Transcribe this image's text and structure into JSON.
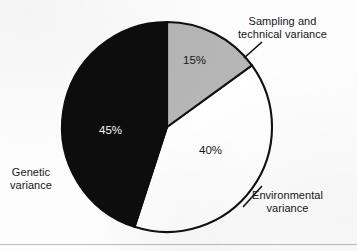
{
  "chart_data": {
    "type": "pie",
    "title": "",
    "subtitle": "",
    "xlabel": "",
    "ylabel": "",
    "legend_position": "none",
    "grid": false,
    "units": "percent",
    "total": 100,
    "start_angle_deg": 0,
    "direction": "clockwise",
    "categories": [
      "Sampling and technical variance",
      "Environmental variance",
      "Genetic variance"
    ],
    "values": [
      15,
      40,
      45
    ],
    "slices": [
      {
        "label": "Sampling and technical variance",
        "label_line1": "Sampling and",
        "label_line2": "technical variance",
        "value": 15,
        "value_label": "15%",
        "fill": "#b6b6b6",
        "stroke": "#111111",
        "value_label_color": "#17181c",
        "start_deg": 0,
        "end_deg": 54
      },
      {
        "label": "Environmental variance",
        "label_line1": "Environmental",
        "label_line2": "variance",
        "value": 40,
        "value_label": "40%",
        "fill": "#ffffff",
        "stroke": "#111111",
        "value_label_color": "#17181c",
        "start_deg": 54,
        "end_deg": 198
      },
      {
        "label": "Genetic variance",
        "label_line1": "Genetic",
        "label_line2": "variance",
        "value": 45,
        "value_label": "45%",
        "fill": "#0d0d0d",
        "stroke": "#0d0d0d",
        "value_label_color": "#f6f6f6",
        "start_deg": 198,
        "end_deg": 360
      }
    ]
  },
  "labels": {
    "sampling": {
      "line1": "Sampling and",
      "line2": "technical variance"
    },
    "environmental": {
      "line1": "Environmental",
      "line2": "variance"
    },
    "genetic": {
      "line1": "Genetic",
      "line2": "variance"
    }
  },
  "percentages": {
    "sampling": "15%",
    "environmental": "40%",
    "genetic": "45%"
  },
  "colors": {
    "background": "#fdfdfd",
    "gray_slice": "#b6b6b6",
    "white_slice": "#ffffff",
    "black_slice": "#0d0d0d",
    "outline": "#111111",
    "text": "#15161a",
    "rule": "#b9bbbe"
  }
}
